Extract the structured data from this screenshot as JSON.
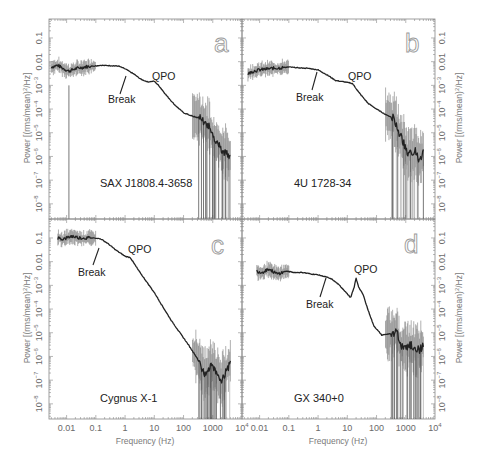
{
  "chart_data": [
    {
      "panel": "a",
      "type": "line",
      "source": "SAX J1808.4-3658",
      "xlabel": "Frequency (Hz)",
      "ylabel": "Power [(rms/mean)^2/Hz]",
      "xscale": "log",
      "yscale": "log",
      "xlim": [
        0.0025,
        10000
      ],
      "ylim": [
        2.2e-09,
        0.63
      ],
      "annotations": [
        {
          "text": "Break",
          "x": 0.6
        },
        {
          "text": "QPO",
          "x": 10
        }
      ],
      "x": [
        0.003,
        0.005,
        0.008,
        0.012,
        0.02,
        0.04,
        0.08,
        0.15,
        0.3,
        0.6,
        1.0,
        2.0,
        3.5,
        6.0,
        10,
        15,
        25,
        50,
        100,
        200,
        400,
        700,
        1000,
        2000,
        4000
      ],
      "y": [
        0.006,
        0.007,
        0.005,
        0.004,
        0.005,
        0.006,
        0.0065,
        0.007,
        0.0068,
        0.0065,
        0.005,
        0.003,
        0.0018,
        0.0014,
        0.0015,
        0.0009,
        0.0004,
        0.00015,
        7e-05,
        5e-05,
        4e-05,
        2e-05,
        8e-06,
        2e-06,
        1e-06
      ]
    },
    {
      "panel": "b",
      "type": "line",
      "source": "4U 1728-34",
      "xlabel": "Frequency (Hz)",
      "ylabel": "Power [(rms/mean)^2/Hz]",
      "xscale": "log",
      "yscale": "log",
      "xlim": [
        0.0025,
        10000
      ],
      "ylim": [
        2.2e-09,
        0.63
      ],
      "annotations": [
        {
          "text": "Break",
          "x": 1.0
        },
        {
          "text": "QPO",
          "x": 15
        }
      ],
      "x": [
        0.004,
        0.006,
        0.01,
        0.02,
        0.05,
        0.1,
        0.2,
        0.5,
        1.0,
        2.0,
        4.0,
        8.0,
        15,
        25,
        50,
        100,
        200,
        400,
        600,
        900,
        1200,
        2000,
        3000,
        4000
      ],
      "y": [
        0.003,
        0.004,
        0.0045,
        0.005,
        0.0055,
        0.006,
        0.0055,
        0.0052,
        0.0045,
        0.0028,
        0.0016,
        0.0014,
        0.0012,
        0.0005,
        0.00018,
        0.0001,
        6e-05,
        4e-05,
        1e-05,
        3e-06,
        1e-06,
        2e-06,
        6e-07,
        2e-06
      ]
    },
    {
      "panel": "c",
      "type": "line",
      "source": "Cygnus X-1",
      "xlabel": "Frequency (Hz)",
      "ylabel": "Power [(rms/mean)^2/Hz]",
      "xscale": "log",
      "yscale": "log",
      "xlim": [
        0.0025,
        10000
      ],
      "ylim": [
        2.2e-09,
        0.63
      ],
      "annotations": [
        {
          "text": "Break",
          "x": 0.15
        },
        {
          "text": "QPO",
          "x": 1.5
        }
      ],
      "x": [
        0.005,
        0.008,
        0.015,
        0.03,
        0.06,
        0.1,
        0.15,
        0.25,
        0.5,
        1.0,
        1.5,
        3.0,
        6.0,
        10,
        20,
        40,
        80,
        150,
        300,
        500,
        1000,
        2000,
        4000
      ],
      "y": [
        0.1,
        0.09,
        0.12,
        0.1,
        0.1,
        0.1,
        0.09,
        0.06,
        0.03,
        0.017,
        0.015,
        0.004,
        0.0012,
        0.0005,
        0.00012,
        3e-05,
        9e-06,
        3e-06,
        8e-07,
        2e-07,
        4e-07,
        1e-07,
        5e-07
      ]
    },
    {
      "panel": "d",
      "type": "line",
      "source": "GX 340+0",
      "xlabel": "Frequency (Hz)",
      "ylabel": "Power [(rms/mean)^2/Hz]",
      "xscale": "log",
      "yscale": "log",
      "xlim": [
        0.0025,
        10000
      ],
      "ylim": [
        2.2e-09,
        0.63
      ],
      "annotations": [
        {
          "text": "Break",
          "x": 3
        },
        {
          "text": "QPO",
          "x": 20
        }
      ],
      "x": [
        0.008,
        0.012,
        0.02,
        0.04,
        0.08,
        0.15,
        0.3,
        0.6,
        1.0,
        2.0,
        3.0,
        5.0,
        8.0,
        13,
        17,
        20,
        25,
        35,
        50,
        80,
        150,
        300,
        500,
        800,
        1500,
        3000,
        4000
      ],
      "y": [
        0.004,
        0.0035,
        0.005,
        0.003,
        0.004,
        0.0035,
        0.0035,
        0.003,
        0.0028,
        0.0022,
        0.0018,
        0.0011,
        0.0006,
        0.0003,
        0.0008,
        0.002,
        0.0008,
        0.0004,
        0.0001,
        2e-05,
        8e-06,
        9e-06,
        1e-05,
        2e-06,
        3e-06,
        2e-06,
        3e-06
      ]
    }
  ],
  "figure": {
    "x_axis_title": "Frequency (Hz)",
    "y_axis_title_parts": [
      "Power [(rms/mean)",
      "2",
      "/Hz]"
    ],
    "x_tick_labels": [
      {
        "value": 0.01,
        "label": "0.01"
      },
      {
        "value": 0.1,
        "label": "0.1"
      },
      {
        "value": 1,
        "label": "1"
      },
      {
        "value": 10,
        "label": "10"
      },
      {
        "value": 100,
        "label": "100"
      },
      {
        "value": 1000,
        "label": "1000"
      },
      {
        "value": 10000,
        "base": "10",
        "exp": "4"
      }
    ],
    "y_tick_labels": [
      {
        "exp": -1,
        "label": "0.1"
      },
      {
        "exp": -2,
        "label": "0.01"
      },
      {
        "exp": -3,
        "base": "10",
        "sup": "−3"
      },
      {
        "exp": -4,
        "base": "10",
        "sup": "−4"
      },
      {
        "exp": -5,
        "base": "10",
        "sup": "−5"
      },
      {
        "exp": -6,
        "base": "10",
        "sup": "−6"
      },
      {
        "exp": -7,
        "base": "10",
        "sup": "−7"
      },
      {
        "exp": -8,
        "base": "10",
        "sup": "−8"
      }
    ],
    "panels": [
      {
        "letter": "a",
        "source": "SAX J1808.4-3658",
        "break_label": "Break",
        "qpo_label": "QPO"
      },
      {
        "letter": "b",
        "source": "4U 1728-34",
        "break_label": "Break",
        "qpo_label": "QPO"
      },
      {
        "letter": "c",
        "source": "Cygnus X-1",
        "break_label": "Break",
        "qpo_label": "QPO"
      },
      {
        "letter": "d",
        "source": "GX 340+0",
        "break_label": "Break",
        "qpo_label": "QPO"
      }
    ]
  }
}
